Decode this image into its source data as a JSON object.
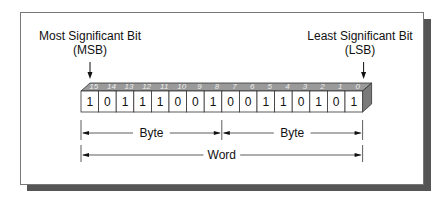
{
  "diagram": {
    "msb": {
      "title": "Most Significant Bit",
      "abbr": "(MSB)"
    },
    "lsb": {
      "title": "Least Significant Bit",
      "abbr": "(LSB)"
    },
    "bit_positions": [
      "15",
      "14",
      "13",
      "12",
      "11",
      "10",
      "9",
      "8",
      "7",
      "6",
      "5",
      "4",
      "3",
      "2",
      "1",
      "0"
    ],
    "bit_values": [
      "1",
      "0",
      "1",
      "1",
      "1",
      "0",
      "0",
      "1",
      "0",
      "0",
      "1",
      "1",
      "0",
      "1",
      "0",
      "1"
    ],
    "byte_label_high": "Byte",
    "byte_label_low": "Byte",
    "word_label": "Word",
    "colors": {
      "top_face": "#9a9a9a",
      "side_face": "#7a7a7a",
      "shadow": "#555555"
    }
  }
}
